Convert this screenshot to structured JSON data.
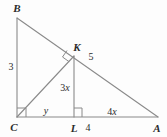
{
  "figure": {
    "type": "geometry-diagram",
    "background_color": "#fdfdfd",
    "stroke_color": "#8a8a8a",
    "label_color": "#2b2b2b",
    "vertices": [
      {
        "name": "B",
        "label": "B",
        "x": 17,
        "y": 18,
        "label_x": 17,
        "label_y": 8
      },
      {
        "name": "K",
        "label": "K",
        "x": 74,
        "y": 56,
        "label_x": 77,
        "label_y": 47
      },
      {
        "name": "C",
        "label": "C",
        "x": 17,
        "y": 117,
        "label_x": 14,
        "label_y": 127
      },
      {
        "name": "L",
        "label": "L",
        "x": 74,
        "y": 117,
        "label_x": 74,
        "label_y": 128
      },
      {
        "name": "A",
        "label": "A",
        "x": 158,
        "y": 117,
        "label_x": 157,
        "label_y": 128
      }
    ],
    "segments": [
      {
        "name": "segment-BC",
        "from": "B",
        "to": "C"
      },
      {
        "name": "segment-BA",
        "from": "B",
        "to": "A"
      },
      {
        "name": "segment-CA",
        "from": "C",
        "to": "A"
      },
      {
        "name": "segment-CK",
        "from": "C",
        "to": "K"
      },
      {
        "name": "segment-KL",
        "from": "K",
        "to": "L"
      }
    ],
    "right_angles": [
      {
        "name": "right-angle-at-C",
        "vertex": "C"
      },
      {
        "name": "right-angle-at-K",
        "vertex": "K"
      },
      {
        "name": "right-angle-at-L",
        "vertex": "L"
      }
    ],
    "measures": [
      {
        "name": "length-BC",
        "text": "3",
        "x": 11,
        "y": 67,
        "style": "measure"
      },
      {
        "name": "length-KA",
        "text": "5",
        "x": 91,
        "y": 57,
        "style": "measure"
      },
      {
        "name": "length-KL",
        "text": "3x",
        "x": 65,
        "y": 88,
        "style": "mixed",
        "number": "3",
        "variable": "x"
      },
      {
        "name": "length-CL",
        "text": "y",
        "x": 46,
        "y": 111,
        "style": "var"
      },
      {
        "name": "length-LA-segment",
        "text": "4",
        "x": 88,
        "y": 128,
        "style": "measure"
      },
      {
        "name": "length-LA",
        "text": "4x",
        "x": 112,
        "y": 112,
        "style": "mixed",
        "number": "4",
        "variable": "x"
      }
    ]
  }
}
